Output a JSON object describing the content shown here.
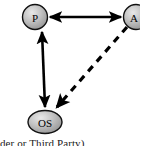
{
  "figure": {
    "type": "node-link-diagram",
    "background_color": "#ffffff",
    "caption": "der or Third Party)"
  },
  "nodes": [
    {
      "id": "p",
      "label": "P",
      "shape": "circle",
      "cx": 35,
      "cy": 17,
      "rx": 12.5,
      "ry": 12.5,
      "fill": "#b0b0b0",
      "stroke": "#111111"
    },
    {
      "id": "a",
      "label": "A",
      "shape": "circle",
      "cx": 136,
      "cy": 17,
      "rx": 12.5,
      "ry": 12.5,
      "fill": "#b0b0b0",
      "stroke": "#111111"
    },
    {
      "id": "os",
      "label": "OS",
      "shape": "ellipse",
      "cx": 45,
      "cy": 122,
      "rx": 17,
      "ry": 11.5,
      "fill": "#b0b0b0",
      "stroke": "#111111"
    }
  ],
  "edges": [
    {
      "id": "p-a",
      "from": "p",
      "to": "a",
      "style": "solid",
      "direction": "bidirectional",
      "stroke": "#000000",
      "width": 2.6
    },
    {
      "id": "p-os",
      "from": "p",
      "to": "os",
      "style": "solid",
      "direction": "bidirectional",
      "stroke": "#000000",
      "width": 2.6
    },
    {
      "id": "a-os",
      "from": "a",
      "to": "os",
      "style": "dashed",
      "direction": "forward",
      "stroke": "#000000",
      "width": 3.2,
      "dash_pattern": "7 6"
    }
  ]
}
